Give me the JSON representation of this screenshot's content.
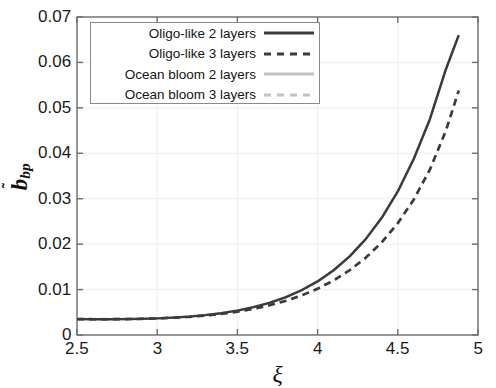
{
  "chart_data": {
    "type": "line",
    "title": "",
    "xlabel": "ξ",
    "ylabel": "b̃_bp",
    "ylabel_base": "b",
    "ylabel_sub": "bp",
    "xlim": [
      2.5,
      5
    ],
    "ylim": [
      0,
      0.07
    ],
    "xticks": [
      "2.5",
      "3",
      "3.5",
      "4",
      "4.5",
      "5"
    ],
    "xtick_values": [
      2.5,
      3,
      3.5,
      4,
      4.5,
      5
    ],
    "yticks": [
      "0",
      "0.01",
      "0.02",
      "0.03",
      "0.04",
      "0.05",
      "0.06",
      "0.07"
    ],
    "ytick_values": [
      0,
      0.01,
      0.02,
      0.03,
      0.04,
      0.05,
      0.06,
      0.07
    ],
    "grid": true,
    "legend_position": "upper-left",
    "x": [
      2.5,
      2.6,
      2.7,
      2.8,
      2.9,
      3.0,
      3.1,
      3.2,
      3.3,
      3.4,
      3.5,
      3.6,
      3.7,
      3.8,
      3.9,
      4.0,
      4.1,
      4.2,
      4.3,
      4.4,
      4.5,
      4.6,
      4.7,
      4.8,
      4.88
    ],
    "series": [
      {
        "name": "Oligo-like 2 layers",
        "style": "solid",
        "color": "#3b3b3b",
        "values": [
          0.0035,
          0.00348,
          0.00348,
          0.0035,
          0.00355,
          0.00365,
          0.00382,
          0.00405,
          0.00437,
          0.0048,
          0.00537,
          0.00612,
          0.00708,
          0.0083,
          0.00985,
          0.0118,
          0.01425,
          0.0173,
          0.0211,
          0.0258,
          0.0316,
          0.0388,
          0.0475,
          0.0585,
          0.066
        ]
      },
      {
        "name": "Oligo-like 3 layers",
        "style": "dashed",
        "color": "#3b3b3b",
        "values": [
          0.0035,
          0.00348,
          0.00348,
          0.0035,
          0.00355,
          0.00365,
          0.0038,
          0.004,
          0.00428,
          0.00465,
          0.00513,
          0.00575,
          0.00653,
          0.0075,
          0.0087,
          0.01018,
          0.012,
          0.01425,
          0.017,
          0.0204,
          0.0246,
          0.02985,
          0.0364,
          0.045,
          0.0538
        ]
      },
      {
        "name": "Ocean bloom 2 layers",
        "style": "solid",
        "color": "#c2c2c2",
        "values": [
          0.00352,
          0.0035,
          0.0035,
          0.00352,
          0.00357,
          0.00367,
          0.00384,
          0.00407,
          0.00439,
          0.00482,
          0.00539,
          0.00614,
          0.0071,
          0.00832,
          0.00987,
          0.01182,
          0.01427,
          0.01732,
          0.02112,
          0.02582,
          0.03162,
          0.03882,
          0.04752,
          0.05852,
          0.066
        ]
      },
      {
        "name": "Ocean bloom 3 layers",
        "style": "dashed",
        "color": "#c2c2c2",
        "values": [
          0.00352,
          0.0035,
          0.0035,
          0.00352,
          0.00357,
          0.00367,
          0.00382,
          0.00402,
          0.0043,
          0.00467,
          0.00515,
          0.00577,
          0.00655,
          0.00752,
          0.00872,
          0.0102,
          0.01202,
          0.01427,
          0.01702,
          0.02042,
          0.02462,
          0.02987,
          0.03642,
          0.04502,
          0.0538
        ]
      }
    ]
  },
  "legend": {
    "items": [
      {
        "label": "Oligo-like 2 layers",
        "style": "solid",
        "color": "#3b3b3b"
      },
      {
        "label": "Oligo-like 3 layers",
        "style": "dashed",
        "color": "#3b3b3b"
      },
      {
        "label": "Ocean bloom 2 layers",
        "style": "solid",
        "color": "#c2c2c2"
      },
      {
        "label": "Ocean bloom 3 layers",
        "style": "dashed",
        "color": "#c2c2c2"
      }
    ]
  },
  "axes": {
    "axis_color": "#6e6e6e",
    "grid_color": "#ededed",
    "tick_text_color": "#1a1a1a"
  }
}
